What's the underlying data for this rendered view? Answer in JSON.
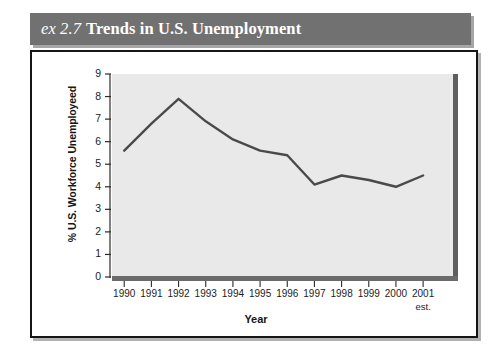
{
  "figure": {
    "label_prefix": "ex 2.7",
    "title": "Trends in U.S. Unemployment",
    "title_bar_color": "#717171",
    "title_text_color": "#ffffff",
    "frame_color": "#151515",
    "plot_background": "#e9e9e9",
    "line_color": "#4a4a4a"
  },
  "chart_data": {
    "type": "line",
    "title": "Trends in U.S. Unemployment",
    "xlabel": "Year",
    "ylabel": "% U.S. Workforce Unemployeed",
    "categories": [
      "1990",
      "1991",
      "1992",
      "1993",
      "1994",
      "1995",
      "1996",
      "1997",
      "1998",
      "1999",
      "2000",
      "2001"
    ],
    "x_tick_sublabels": [
      "",
      "",
      "",
      "",
      "",
      "",
      "",
      "",
      "",
      "",
      "",
      "est."
    ],
    "values": [
      5.6,
      6.8,
      7.9,
      6.9,
      6.1,
      5.6,
      5.4,
      4.1,
      4.5,
      4.3,
      4.0,
      4.5
    ],
    "ylim": [
      0,
      9
    ],
    "y_ticks": [
      9,
      8,
      7,
      6,
      5,
      4,
      3,
      2,
      1,
      0
    ],
    "y_tick_labels": [
      "9",
      "8",
      "7",
      "6",
      "5",
      "4",
      "3",
      "2",
      "1",
      "0"
    ],
    "grid": false,
    "legend": null,
    "series": [
      {
        "name": "% U.S. Workforce Unemployeed",
        "values": [
          5.6,
          6.8,
          7.9,
          6.9,
          6.1,
          5.6,
          5.4,
          4.1,
          4.5,
          4.3,
          4.0,
          4.5
        ]
      }
    ]
  }
}
